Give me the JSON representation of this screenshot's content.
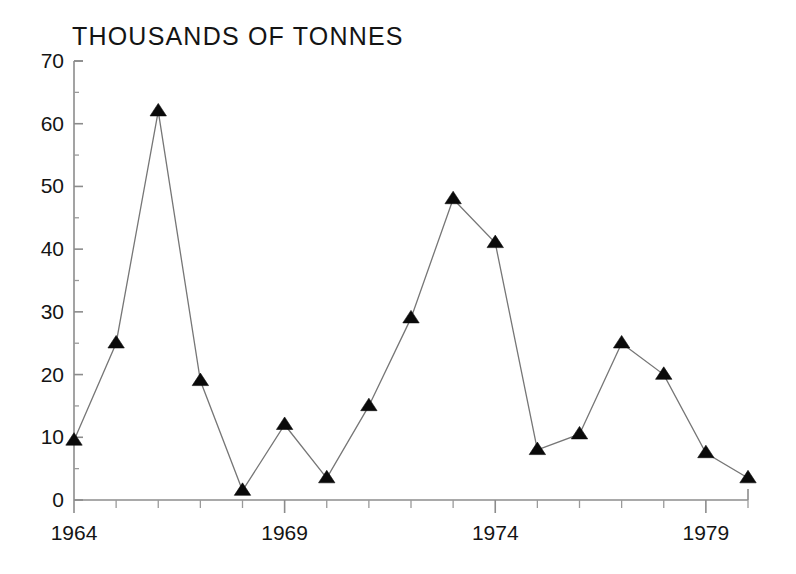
{
  "chart_data": {
    "type": "line",
    "title": "THOUSANDS OF TONNES",
    "xlabel": "",
    "ylabel": "",
    "x": [
      1964,
      1965,
      1966,
      1967,
      1968,
      1969,
      1970,
      1971,
      1972,
      1973,
      1974,
      1975,
      1976,
      1977,
      1978,
      1979,
      1980
    ],
    "values": [
      9.5,
      25,
      62,
      19,
      1.5,
      12,
      3.5,
      15,
      29,
      48,
      41,
      8,
      10.5,
      25,
      20,
      7.5,
      3.5
    ],
    "series": [
      {
        "name": "Thousands of tonnes",
        "values": [
          9.5,
          25,
          62,
          19,
          1.5,
          12,
          3.5,
          15,
          29,
          48,
          41,
          8,
          10.5,
          25,
          20,
          7.5,
          3.5
        ]
      }
    ],
    "x_tick_labels": [
      "1964",
      "1969",
      "1974",
      "1979"
    ],
    "x_tick_label_values": [
      1964,
      1969,
      1974,
      1979
    ],
    "y_tick_labels": [
      "0",
      "10",
      "20",
      "30",
      "40",
      "50",
      "60",
      "70"
    ],
    "y_tick_values": [
      0,
      10,
      20,
      30,
      40,
      50,
      60,
      70
    ],
    "xlim": [
      1964,
      1980
    ],
    "ylim": [
      0,
      70
    ],
    "y_minor_step": 5,
    "grid": false,
    "legend": false,
    "marker": "triangle-up",
    "marker_color": "#0a0a0a",
    "line_color": "#767676",
    "axis_color": "#8c8c8c",
    "background": "#ffffff"
  },
  "titles": {
    "chart": "THOUSANDS OF TONNES"
  },
  "axes": {
    "y_labels": [
      "70",
      "60",
      "50",
      "40",
      "30",
      "20",
      "10",
      "0"
    ],
    "x_labels": [
      "1964",
      "1969",
      "1974",
      "1979"
    ]
  }
}
